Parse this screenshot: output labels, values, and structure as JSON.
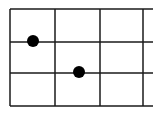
{
  "diagram": {
    "type": "grid-dot-diagram",
    "line_color": "#1a1a1a",
    "dot_color": "#000000",
    "background": "#ffffff",
    "horizontal_lines_y": [
      9,
      42,
      73,
      106
    ],
    "horizontal_x_range": [
      10,
      153
    ],
    "vertical_lines_x": [
      10,
      55,
      100,
      143
    ],
    "vertical_y_range": [
      9,
      106
    ],
    "dots": [
      {
        "cx": 33,
        "cy": 41,
        "r": 6
      },
      {
        "cx": 79,
        "cy": 72,
        "r": 6
      }
    ]
  }
}
